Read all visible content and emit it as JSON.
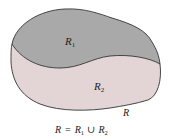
{
  "diagram": {
    "type": "region-decomposition",
    "regions": [
      {
        "id": "R1",
        "label_main": "R",
        "label_sub": "1",
        "color": "#a9a9a9"
      },
      {
        "id": "R2",
        "label_main": "R",
        "label_sub": "2",
        "color": "#e3d5d5"
      }
    ],
    "outline_color": "#333333",
    "outer_label": "R",
    "caption": {
      "lhs": "R",
      "equals": "=",
      "term1_main": "R",
      "term1_sub": "1",
      "union": "∪",
      "term2_main": "R",
      "term2_sub": "2"
    }
  }
}
